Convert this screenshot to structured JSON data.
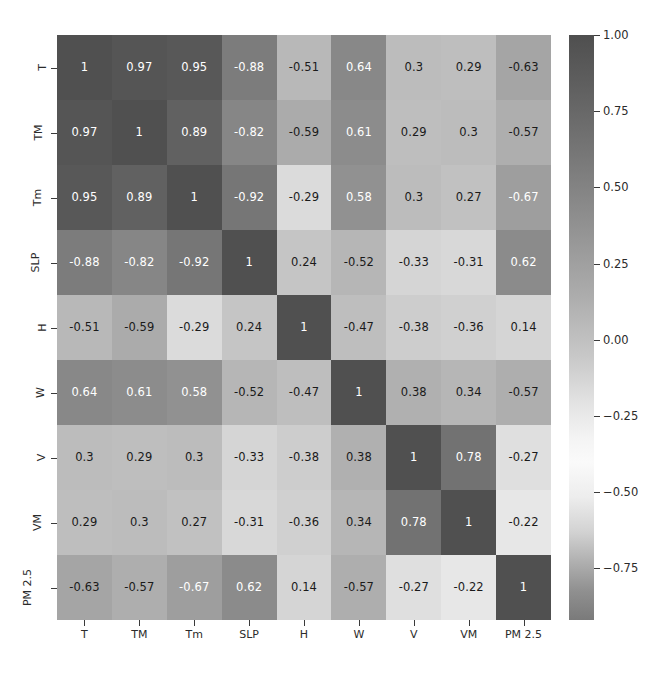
{
  "chart_data": {
    "type": "heatmap",
    "title": "",
    "xlabel": "",
    "ylabel": "",
    "grid": false,
    "legend_position": "right",
    "colormap": "grayscale-diverging",
    "annotated": true,
    "categories": [
      "T",
      "TM",
      "Tm",
      "SLP",
      "H",
      "W",
      "V",
      "VM",
      "PM 2.5"
    ],
    "x_tick_labels": [
      "T",
      "TM",
      "Tm",
      "SLP",
      "H",
      "W",
      "V",
      "VM",
      "PM 2.5"
    ],
    "y_tick_labels": [
      "T",
      "TM",
      "Tm",
      "SLP",
      "H",
      "W",
      "V",
      "VM",
      "PM 2.5"
    ],
    "colorbar": {
      "ticks": [
        "1.00",
        "0.75",
        "0.50",
        "0.25",
        "0.00",
        "−0.25",
        "−0.50",
        "−0.75"
      ],
      "tick_values": [
        1.0,
        0.75,
        0.5,
        0.25,
        0.0,
        -0.25,
        -0.5,
        -0.75
      ],
      "vmin": -0.92,
      "vmax": 1.0
    },
    "matrix": [
      [
        1,
        0.97,
        0.95,
        -0.88,
        -0.51,
        0.64,
        0.3,
        0.29,
        -0.63
      ],
      [
        0.97,
        1,
        0.89,
        -0.82,
        -0.59,
        0.61,
        0.29,
        0.3,
        -0.57
      ],
      [
        0.95,
        0.89,
        1,
        -0.92,
        -0.29,
        0.58,
        0.3,
        0.27,
        -0.67
      ],
      [
        -0.88,
        -0.82,
        -0.92,
        1,
        0.24,
        -0.52,
        -0.33,
        -0.31,
        0.62
      ],
      [
        -0.51,
        -0.59,
        -0.29,
        0.24,
        1,
        -0.47,
        -0.38,
        -0.36,
        0.14
      ],
      [
        0.64,
        0.61,
        0.58,
        -0.52,
        -0.47,
        1,
        0.38,
        0.34,
        -0.57
      ],
      [
        0.3,
        0.29,
        0.3,
        -0.33,
        -0.38,
        0.38,
        1,
        0.78,
        -0.27
      ],
      [
        0.29,
        0.3,
        0.27,
        -0.31,
        -0.36,
        0.34,
        0.78,
        1,
        -0.22
      ],
      [
        -0.63,
        -0.57,
        -0.67,
        0.62,
        0.14,
        -0.57,
        -0.27,
        -0.22,
        1
      ]
    ],
    "cell_labels": [
      [
        "1",
        "0.97",
        "0.95",
        "-0.88",
        "-0.51",
        "0.64",
        "0.3",
        "0.29",
        "-0.63"
      ],
      [
        "0.97",
        "1",
        "0.89",
        "-0.82",
        "-0.59",
        "0.61",
        "0.29",
        "0.3",
        "-0.57"
      ],
      [
        "0.95",
        "0.89",
        "1",
        "-0.92",
        "-0.29",
        "0.58",
        "0.3",
        "0.27",
        "-0.67"
      ],
      [
        "-0.88",
        "-0.82",
        "-0.92",
        "1",
        "0.24",
        "-0.52",
        "-0.33",
        "-0.31",
        "0.62"
      ],
      [
        "-0.51",
        "-0.59",
        "-0.29",
        "0.24",
        "1",
        "-0.47",
        "-0.38",
        "-0.36",
        "0.14"
      ],
      [
        "0.64",
        "0.61",
        "0.58",
        "-0.52",
        "-0.47",
        "1",
        "0.38",
        "0.34",
        "-0.57"
      ],
      [
        "0.3",
        "0.29",
        "0.3",
        "-0.33",
        "-0.38",
        "0.38",
        "1",
        "0.78",
        "-0.27"
      ],
      [
        "0.29",
        "0.3",
        "0.27",
        "-0.31",
        "-0.36",
        "0.34",
        "0.78",
        "1",
        "-0.22"
      ],
      [
        "-0.63",
        "-0.57",
        "-0.67",
        "0.62",
        "0.14",
        "-0.57",
        "-0.27",
        "-0.22",
        "1"
      ]
    ]
  },
  "colors": {
    "dark_cell": "#4f4f4f",
    "light_cell": "#fafafa",
    "text_light": "#ffffff",
    "text_dark": "#1a1a1a",
    "axis": "#3a3a3a",
    "background": "#ffffff"
  }
}
